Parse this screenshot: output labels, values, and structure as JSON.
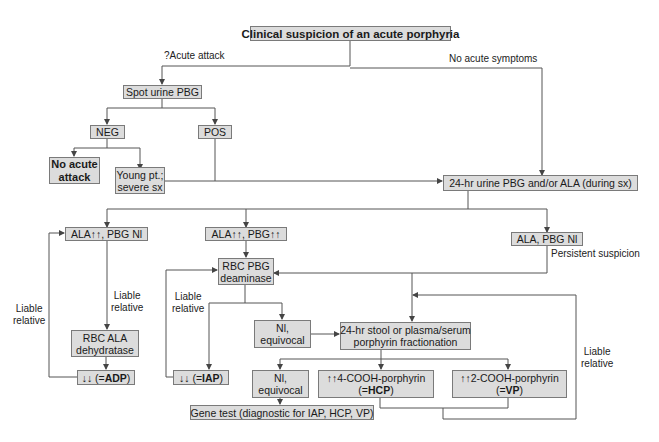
{
  "diagram": {
    "type": "flowchart",
    "title": "Clinical suspicion of an acute porphyria",
    "colors": {
      "box_fill": "#dcdcdc",
      "box_border": "#7a7a7a",
      "line": "#555555",
      "text": "#1a1a1a"
    },
    "branch_labels": {
      "acute_attack": "?Acute attack",
      "no_acute_symptoms": "No acute symptoms",
      "persistent_suspicion": "Persistent suspicion",
      "liable_relative_left_outer_1": "Liable",
      "liable_relative_left_outer_2": "relative",
      "liable_relative_left_inner_1": "Liable",
      "liable_relative_left_inner_2": "relative",
      "liable_relative_mid_1": "Liable",
      "liable_relative_mid_2": "relative",
      "liable_relative_right_1": "Liable",
      "liable_relative_right_2": "relative"
    },
    "nodes": {
      "spot_urine": "Spot urine PBG",
      "neg": "NEG",
      "pos": "POS",
      "no_acute_attack_1": "No acute",
      "no_acute_attack_2": "attack",
      "young_pt_1": "Young pt.;",
      "young_pt_2": "severe sx",
      "urine_24hr": "24-hr urine PBG and/or ALA (during sx)",
      "ala_up_pbg_nl": "ALA↑↑, PBG Nl",
      "ala_up_pbg_up": "ALA↑↑, PBG↑↑",
      "ala_pbg_nl": "ALA, PBG Nl",
      "rbc_pbg_1": "RBC PBG",
      "rbc_pbg_2": "deaminase",
      "rbc_ala_1": "RBC ALA",
      "rbc_ala_2": "dehydratase",
      "adp_prefix": "↓↓ (=",
      "adp_bold": "ADP",
      "adp_suffix": ")",
      "iap_prefix": "↓↓ (=",
      "iap_bold": "IAP",
      "iap_suffix": ")",
      "nl_equiv_upper_1": "Nl,",
      "nl_equiv_upper_2": "equivocal",
      "stool_1": "24-hr stool or plasma/serum",
      "stool_2": "porphyrin fractionation",
      "nl_equiv_lower_1": "Nl,",
      "nl_equiv_lower_2": "equivocal",
      "hcp_1": "↑↑4-COOH-porphyrin",
      "hcp_prefix": "(=",
      "hcp_bold": "HCP",
      "hcp_suffix": ")",
      "vp_1": "↑↑2-COOH-porphyrin",
      "vp_prefix": "(=",
      "vp_bold": "VP",
      "vp_suffix": ")",
      "gene_test": "Gene test (diagnostic for IAP, HCP, VP)"
    },
    "edges": [
      [
        "Clinical suspicion",
        "Spot urine PBG",
        "?Acute attack"
      ],
      [
        "Clinical suspicion",
        "24-hr urine PBG and/or ALA",
        "No acute symptoms"
      ],
      [
        "Spot urine PBG",
        "NEG"
      ],
      [
        "Spot urine PBG",
        "POS"
      ],
      [
        "NEG",
        "No acute attack"
      ],
      [
        "NEG",
        "Young pt.; severe sx"
      ],
      [
        "Young pt.; severe sx",
        "24-hr urine PBG and/or ALA"
      ],
      [
        "POS",
        "24-hr urine PBG and/or ALA"
      ],
      [
        "24-hr urine PBG and/or ALA",
        "ALA↑↑, PBG Nl"
      ],
      [
        "24-hr urine PBG and/or ALA",
        "ALA↑↑, PBG↑↑"
      ],
      [
        "24-hr urine PBG and/or ALA",
        "ALA, PBG Nl"
      ],
      [
        "ALA↑↑, PBG Nl",
        "RBC ALA dehydratase",
        "Liable relative"
      ],
      [
        "RBC ALA dehydratase",
        "↓↓ (=ADP)"
      ],
      [
        "↓↓ (=ADP)",
        "ALA↑↑, PBG Nl",
        "Liable relative"
      ],
      [
        "ALA↑↑, PBG↑↑",
        "RBC PBG deaminase"
      ],
      [
        "ALA, PBG Nl",
        "RBC PBG deaminase",
        "Persistent suspicion"
      ],
      [
        "ALA, PBG Nl",
        "24-hr stool or plasma/serum porphyrin fractionation",
        "Persistent suspicion"
      ],
      [
        "RBC PBG deaminase",
        "↓↓ (=IAP)"
      ],
      [
        "RBC PBG deaminase",
        "Nl, equivocal (upper)"
      ],
      [
        "↓↓ (=IAP)",
        "RBC PBG deaminase",
        "Liable relative"
      ],
      [
        "Nl, equivocal (upper)",
        "24-hr stool or plasma/serum porphyrin fractionation"
      ],
      [
        "24-hr stool",
        "Nl, equivocal (lower)"
      ],
      [
        "24-hr stool",
        "↑↑4-COOH-porphyrin (=HCP)"
      ],
      [
        "24-hr stool",
        "↑↑2-COOH-porphyrin (=VP)"
      ],
      [
        "HCP / VP",
        "24-hr stool",
        "Liable relative"
      ],
      [
        "Nl, equivocal (lower)",
        "Gene test (diagnostic for IAP, HCP, VP)"
      ]
    ]
  }
}
